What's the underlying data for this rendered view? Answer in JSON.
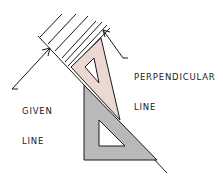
{
  "diagram": {
    "labels": {
      "perpendicular": {
        "line1": "PERPENDICULAR",
        "line2": "LINE"
      },
      "given": {
        "line1": "GIVEN",
        "line2": "LINE"
      }
    },
    "colors": {
      "stroke": "#1a1a1a",
      "triangle_45_fill": "#ecd8d3",
      "triangle_30_60_fill": "#b9b9b9",
      "background": "#ffffff"
    },
    "elements": [
      "given-line",
      "hatch-lines",
      "triangle-45",
      "triangle-30-60",
      "perpendicular-arrow",
      "given-arrow"
    ]
  }
}
